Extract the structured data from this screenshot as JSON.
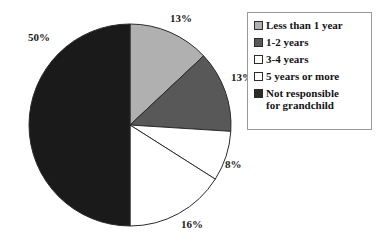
{
  "chart_data": {
    "type": "pie",
    "title": "",
    "xlabel": "",
    "ylabel": "",
    "unit": "%",
    "start_angle_deg": 0,
    "direction": "clockwise",
    "legend_position": "right",
    "grid": false,
    "categories": [
      "Less than 1 year",
      "1-2 years",
      "3-4 years",
      "5 years or more",
      "Not responsible for grandchild"
    ],
    "values": [
      13,
      13,
      8,
      16,
      50
    ],
    "data_labels": [
      "13%",
      "13%",
      "8%",
      "16%",
      "50%"
    ],
    "colors": [
      "#b0b0b0",
      "#585858",
      "#ffffff",
      "#ffffff",
      "#1a1a1a"
    ]
  },
  "pie": {
    "center_x": 130,
    "center_y": 125,
    "radius": 101,
    "stroke": "#2b2b2b",
    "slices": [
      {
        "label": "Less than 1 year",
        "value": 13,
        "display": "13%",
        "fill": "#b0b0b0"
      },
      {
        "label": "1-2 years",
        "value": 13,
        "display": "13%",
        "fill": "#585858"
      },
      {
        "label": "3-4 years",
        "value": 8,
        "display": "8%",
        "fill": "#ffffff"
      },
      {
        "label": "5 years or more",
        "value": 16,
        "display": "16%",
        "fill": "#ffffff"
      },
      {
        "label": "Not responsible for grandchild",
        "value": 50,
        "display": "50%",
        "fill": "#1a1a1a"
      }
    ],
    "labels": {
      "top_13": "13%",
      "right_13": "13%",
      "pct_8": "8%",
      "pct_16": "16%",
      "pct_50": "50%"
    }
  },
  "legend": {
    "border_color": "#9a9a9a",
    "items": [
      {
        "label": "Less than 1 year",
        "swatch": "#b0b0b0"
      },
      {
        "label": "1-2 years",
        "swatch": "#585858"
      },
      {
        "label": "3-4 years",
        "swatch": "#ffffff"
      },
      {
        "label": "5 years or more",
        "swatch": "#ffffff"
      },
      {
        "label_line1": "Not responsible",
        "label_line2": "for grandchild",
        "swatch": "#2b2b2b"
      }
    ]
  }
}
